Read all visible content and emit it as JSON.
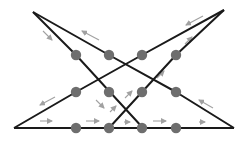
{
  "diagram": {
    "title": "",
    "colors": {
      "line": "#1a1a1a",
      "node": "#6e6e6e",
      "arrow": "#8a8a8a",
      "background": "#ffffff"
    },
    "lines": [
      {
        "id": "line-1",
        "points": [
          [
            33,
            12
          ],
          [
            76,
            55
          ],
          [
            109,
            91
          ],
          [
            143,
            128
          ]
        ]
      },
      {
        "id": "line-2",
        "points": [
          [
            33,
            12
          ],
          [
            109,
            55
          ],
          [
            176,
            92
          ],
          [
            234,
            128
          ]
        ]
      },
      {
        "id": "line-3",
        "points": [
          [
            14,
            128
          ],
          [
            76,
            92
          ],
          [
            142,
            55
          ],
          [
            224,
            10
          ]
        ]
      },
      {
        "id": "line-4",
        "points": [
          [
            109,
            128
          ],
          [
            142,
            92
          ],
          [
            176,
            55
          ],
          [
            224,
            10
          ]
        ]
      },
      {
        "id": "base-line",
        "points": [
          [
            14,
            128
          ],
          [
            234,
            128
          ]
        ]
      }
    ],
    "nodes": [
      {
        "id": "n1",
        "x": 76,
        "y": 55
      },
      {
        "id": "n2",
        "x": 109,
        "y": 55
      },
      {
        "id": "n3",
        "x": 142,
        "y": 55
      },
      {
        "id": "n4",
        "x": 176,
        "y": 55
      },
      {
        "id": "n5",
        "x": 76,
        "y": 92
      },
      {
        "id": "n6",
        "x": 109,
        "y": 92
      },
      {
        "id": "n7",
        "x": 142,
        "y": 92
      },
      {
        "id": "n8",
        "x": 176,
        "y": 92
      },
      {
        "id": "n9",
        "x": 76,
        "y": 128
      },
      {
        "id": "n10",
        "x": 109,
        "y": 128
      },
      {
        "id": "n11",
        "x": 142,
        "y": 128
      },
      {
        "id": "n12",
        "x": 176,
        "y": 128
      }
    ],
    "arrows": [
      {
        "id": "a1",
        "x1": 43,
        "y1": 31,
        "x2": 52,
        "y2": 40
      },
      {
        "id": "a2",
        "x1": 99,
        "y1": 40,
        "x2": 82,
        "y2": 31
      },
      {
        "id": "a3",
        "x1": 203,
        "y1": 16,
        "x2": 186,
        "y2": 25
      },
      {
        "id": "a4",
        "x1": 185,
        "y1": 44,
        "x2": 192,
        "y2": 37
      },
      {
        "id": "a5",
        "x1": 55,
        "y1": 97,
        "x2": 40,
        "y2": 105
      },
      {
        "id": "a6",
        "x1": 96,
        "y1": 100,
        "x2": 104,
        "y2": 108
      },
      {
        "id": "a7",
        "x1": 110,
        "y1": 112,
        "x2": 116,
        "y2": 106
      },
      {
        "id": "a8",
        "x1": 125,
        "y1": 98,
        "x2": 132,
        "y2": 91
      },
      {
        "id": "a9",
        "x1": 157,
        "y1": 78,
        "x2": 164,
        "y2": 71
      },
      {
        "id": "a10",
        "x1": 213,
        "y1": 108,
        "x2": 199,
        "y2": 100
      },
      {
        "id": "a11",
        "x1": 40,
        "y1": 121,
        "x2": 52,
        "y2": 121
      },
      {
        "id": "a12",
        "x1": 86,
        "y1": 121,
        "x2": 99,
        "y2": 121
      },
      {
        "id": "a13",
        "x1": 124,
        "y1": 122,
        "x2": 130,
        "y2": 122
      },
      {
        "id": "a14",
        "x1": 153,
        "y1": 121,
        "x2": 166,
        "y2": 121
      },
      {
        "id": "a15",
        "x1": 199,
        "y1": 122,
        "x2": 205,
        "y2": 122
      }
    ]
  }
}
